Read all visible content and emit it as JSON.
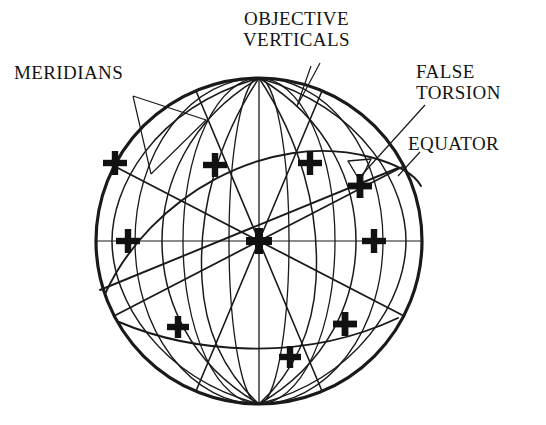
{
  "figure": {
    "background_color": "#ffffff",
    "line_color": "#1a1a1a"
  },
  "labels": {
    "meridians": {
      "text": "MERIDIANS",
      "lines": [
        "MERIDIANS"
      ]
    },
    "objective_verticals": {
      "text": "OBJECTIVE VERTICALS",
      "lines": [
        "OBJECTIVE",
        "VERTICALS"
      ]
    },
    "false_torsion": {
      "text": "FALSE TORSION",
      "lines": [
        "FALSE",
        "TORSION"
      ]
    },
    "equator": {
      "text": "EQUATOR",
      "lines": [
        "EQUATOR"
      ]
    }
  },
  "diagram_data": {
    "type": "diagram",
    "sphere": {
      "center": [
        259,
        241
      ],
      "radius_x": 163,
      "radius_y": 163,
      "north_pole": [
        259,
        78
      ],
      "south_pole": [
        259,
        404
      ]
    },
    "meridian_arcs_rx": [
      30,
      76,
      124,
      163
    ],
    "objective_vertical_angles_deg": [
      0,
      45,
      90,
      135,
      180,
      225,
      270,
      315
    ],
    "tilted_great_circle_angle_deg": 24,
    "equator_line": {
      "from": [
        96,
        241
      ],
      "to": [
        422,
        241
      ]
    },
    "cross_markers": [
      {
        "name": "upper-left-outer",
        "x": 115,
        "y": 163
      },
      {
        "name": "upper-left-inner",
        "x": 215,
        "y": 165
      },
      {
        "name": "upper-right-inner",
        "x": 310,
        "y": 163
      },
      {
        "name": "false-torsion-point",
        "x": 360,
        "y": 186
      },
      {
        "name": "equator-left",
        "x": 128,
        "y": 241
      },
      {
        "name": "center",
        "x": 259,
        "y": 241
      },
      {
        "name": "equator-right",
        "x": 374,
        "y": 241
      },
      {
        "name": "lower-left",
        "x": 178,
        "y": 327
      },
      {
        "name": "lower-center",
        "x": 290,
        "y": 357
      },
      {
        "name": "lower-right",
        "x": 345,
        "y": 324
      }
    ],
    "angle_marker": {
      "name": "false-torsion-angle",
      "vertex": [
        360,
        186
      ]
    }
  }
}
